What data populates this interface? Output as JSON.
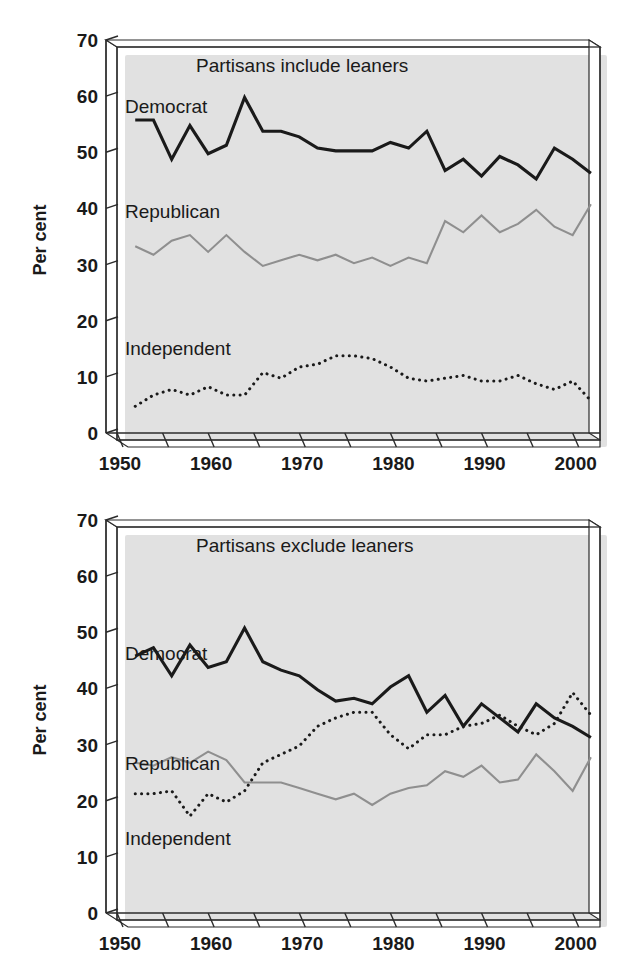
{
  "figure": {
    "caption": ""
  },
  "axis": {
    "ylabel": "Per cent",
    "yticks": [
      "0",
      "10",
      "20",
      "30",
      "40",
      "50",
      "60",
      "70"
    ],
    "xticks_labeled": [
      "1950",
      "1960",
      "1970",
      "1980",
      "1990",
      "2000"
    ]
  },
  "colors": {
    "democrat": "#1a1a1a",
    "republican": "#8f8f8f",
    "independent": "#1a1a1a",
    "axis": "#2b2b2b",
    "background": "#ffffff"
  },
  "labels": {
    "democrat": "Democrat",
    "republican": "Republican",
    "independent": "Independent"
  },
  "chart_data": [
    {
      "id": "top",
      "type": "line",
      "title": "Partisans include leaners",
      "xlabel": "",
      "ylabel": "Per cent",
      "xlim": [
        1950,
        2003
      ],
      "ylim": [
        0,
        70
      ],
      "ytick_step": 10,
      "xtick_step": 5,
      "xtick_labels_every": 10,
      "grid": false,
      "legend": "inline-labels",
      "x": [
        1952,
        1954,
        1956,
        1958,
        1960,
        1962,
        1964,
        1966,
        1968,
        1970,
        1972,
        1974,
        1976,
        1978,
        1980,
        1982,
        1984,
        1986,
        1988,
        1990,
        1992,
        1994,
        1996,
        1998,
        2000,
        2002
      ],
      "series": [
        {
          "name": "Democrat",
          "style": "solid-heavy",
          "color": "#1a1a1a",
          "values": [
            57,
            57,
            50,
            56,
            51,
            52.5,
            61,
            55,
            55,
            54,
            52,
            51.5,
            51.5,
            51.5,
            53,
            52,
            55,
            48,
            50,
            47,
            50.5,
            49,
            46.5,
            52,
            50,
            47.5
          ]
        },
        {
          "name": "Republican",
          "style": "solid-light",
          "color": "#8f8f8f",
          "values": [
            34.5,
            33,
            35.5,
            36.5,
            33.5,
            36.5,
            33.5,
            31,
            32,
            33,
            32,
            33,
            31.5,
            32.5,
            31,
            32.5,
            31.5,
            39,
            37,
            40,
            37,
            38.5,
            41,
            38,
            36.5,
            42
          ]
        },
        {
          "name": "Independent",
          "style": "dotted",
          "color": "#1a1a1a",
          "values": [
            6,
            8,
            9,
            8,
            9.5,
            8,
            8,
            12,
            11,
            13,
            13.5,
            15,
            15,
            14.5,
            13,
            11,
            10.5,
            11,
            11.5,
            10.5,
            10.5,
            11.5,
            10,
            9,
            10.5,
            7
          ]
        }
      ]
    },
    {
      "id": "bottom",
      "type": "line",
      "title": "Partisans exclude leaners",
      "xlabel": "",
      "ylabel": "Per cent",
      "xlim": [
        1950,
        2003
      ],
      "ylim": [
        0,
        70
      ],
      "ytick_step": 10,
      "xtick_step": 5,
      "xtick_labels_every": 10,
      "grid": false,
      "legend": "inline-labels",
      "x": [
        1952,
        1954,
        1956,
        1958,
        1960,
        1962,
        1964,
        1966,
        1968,
        1970,
        1972,
        1974,
        1976,
        1978,
        1980,
        1982,
        1984,
        1986,
        1988,
        1990,
        1992,
        1994,
        1996,
        1998,
        2000,
        2002
      ],
      "series": [
        {
          "name": "Democrat",
          "style": "solid-heavy",
          "color": "#1a1a1a",
          "values": [
            47,
            48.5,
            43.5,
            49,
            45,
            46,
            52,
            46,
            44.5,
            43.5,
            41,
            39,
            39.5,
            38.5,
            41.5,
            43.5,
            37,
            40,
            34.5,
            38.5,
            36,
            33.5,
            38.5,
            36,
            34.5,
            32.5
          ]
        },
        {
          "name": "Republican",
          "style": "solid-light",
          "color": "#8f8f8f",
          "values": [
            28,
            27.5,
            29,
            28,
            30,
            28.5,
            24.5,
            24.5,
            24.5,
            23.5,
            22.5,
            21.5,
            22.5,
            20.5,
            22.5,
            23.5,
            24,
            26.5,
            25.5,
            27.5,
            24.5,
            25,
            29.5,
            26.5,
            23,
            29
          ]
        },
        {
          "name": "Independent",
          "style": "dotted",
          "color": "#1a1a1a",
          "values": [
            22.5,
            22.5,
            23,
            18.5,
            22.5,
            21,
            23,
            28,
            29.5,
            31,
            34.5,
            36,
            37,
            37,
            33,
            30.5,
            33,
            33,
            34.5,
            35,
            36.5,
            34.5,
            33,
            35,
            40.5,
            36.5
          ]
        }
      ]
    }
  ]
}
